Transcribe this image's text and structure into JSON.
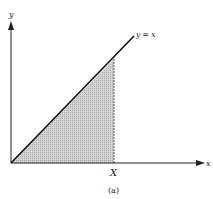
{
  "diagram": {
    "axis_labels": {
      "x": "x",
      "y": "y"
    },
    "line_label": "y = x",
    "point_label": "X",
    "caption": "(a)",
    "colors": {
      "ink": "#1a1a1a",
      "shade": "#c8c8c8"
    }
  }
}
